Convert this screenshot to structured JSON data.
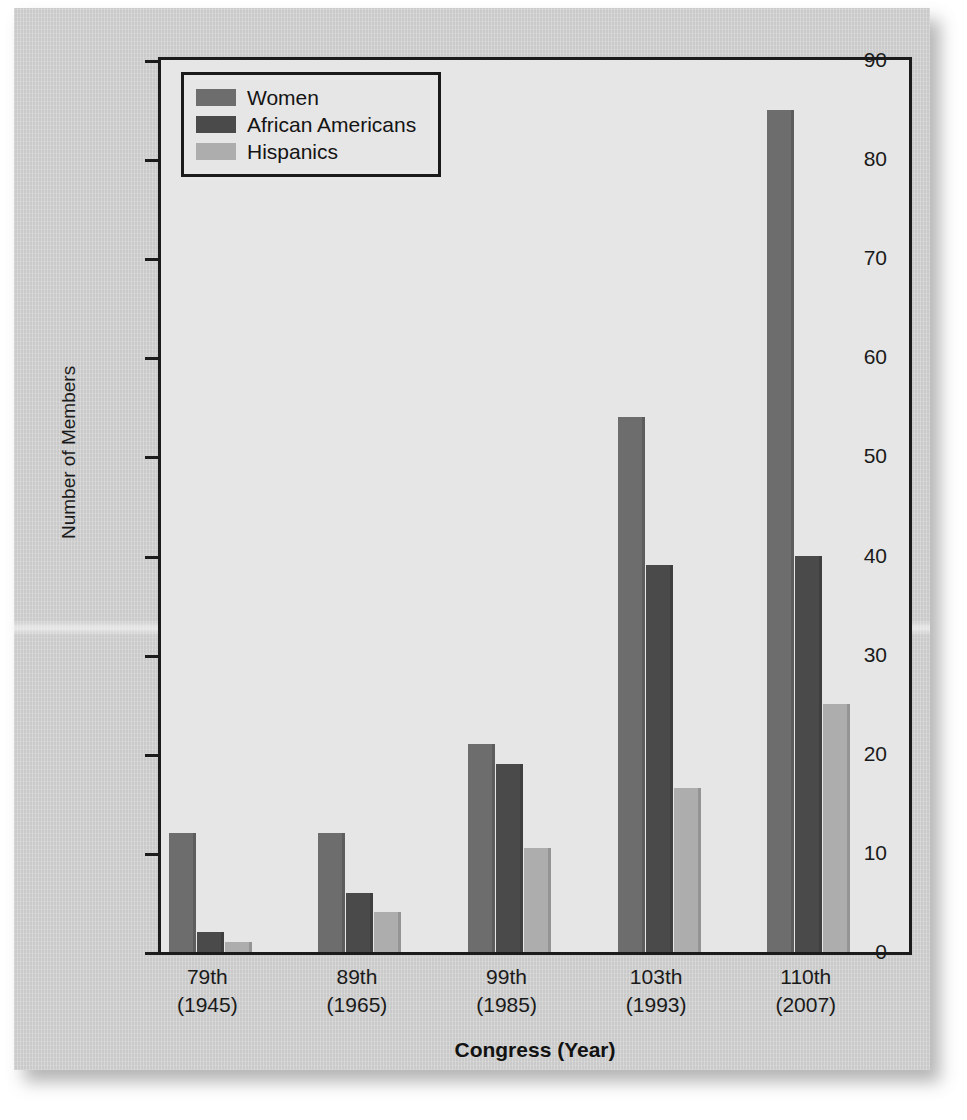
{
  "chart_data": {
    "type": "bar",
    "title": "",
    "xlabel": "Congress (Year)",
    "ylabel": "Number of Members",
    "categories": [
      "79th\n(1945)",
      "89th\n(1965)",
      "99th\n(1985)",
      "103th\n(1993)",
      "110th\n(2007)"
    ],
    "category_lines": [
      {
        "top": "79th",
        "bottom": "(1945)"
      },
      {
        "top": "89th",
        "bottom": "(1965)"
      },
      {
        "top": "99th",
        "bottom": "(1985)"
      },
      {
        "top": "103th",
        "bottom": "(1993)"
      },
      {
        "top": "110th",
        "bottom": "(2007)"
      }
    ],
    "series": [
      {
        "name": "Women",
        "color": "#6d6d6d",
        "values": [
          12,
          12,
          21,
          54,
          85
        ]
      },
      {
        "name": "African Americans",
        "color": "#4a4a4a",
        "values": [
          2,
          6,
          19,
          39,
          40
        ]
      },
      {
        "name": "Hispanics",
        "color": "#adadad",
        "values": [
          1,
          4,
          10.5,
          16.5,
          25
        ]
      }
    ],
    "ylim": [
      0,
      90
    ],
    "yticks": [
      0,
      10,
      20,
      30,
      40,
      50,
      60,
      70,
      80,
      90
    ],
    "ytick_labels": [
      "0",
      "10",
      "20",
      "30",
      "40",
      "50",
      "60",
      "70",
      "80",
      "90"
    ],
    "grid": false,
    "legend_position": "top-left",
    "plot_background": "#e6e6e6",
    "frame_color": "#1b1b1b",
    "page_background": "#cfcfcf"
  }
}
